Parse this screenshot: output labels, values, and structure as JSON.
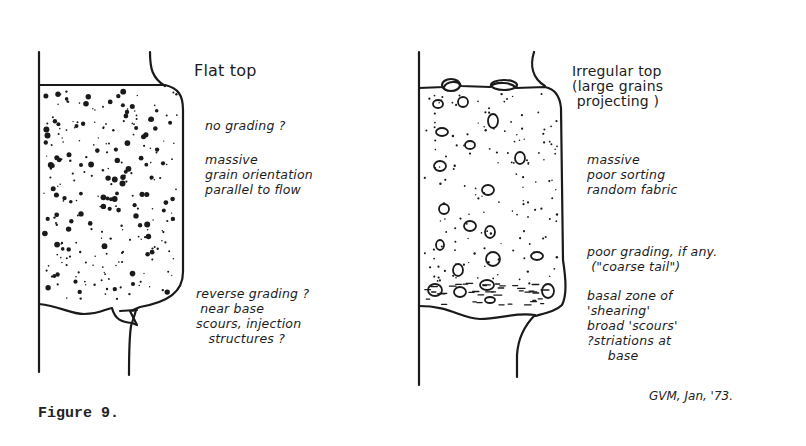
{
  "figure": {
    "caption": "Figure 9.",
    "signature": "GVM, Jan, '73.",
    "ink_color": "#1a1a1a",
    "paper_color": "#ffffff"
  },
  "left_bed": {
    "title": "Flat top",
    "notes": [
      {
        "id": "grading",
        "text": "no grading ?"
      },
      {
        "id": "fabric",
        "text": "massive\ngrain orientation\nparallel to flow"
      },
      {
        "id": "base",
        "text": "reverse grading ?\n near base\nscours, injection\n   structures ?"
      }
    ]
  },
  "right_bed": {
    "title": "Irregular top\n(large grains\n projecting )",
    "notes": [
      {
        "id": "fabric",
        "text": "massive\npoor sorting\nrandom fabric"
      },
      {
        "id": "grading",
        "text": "poor grading, if any.\n (\"coarse tail\")"
      },
      {
        "id": "base",
        "text": "basal zone of\n'shearing'\nbroad 'scours'\n?striations at\n     base"
      }
    ]
  }
}
